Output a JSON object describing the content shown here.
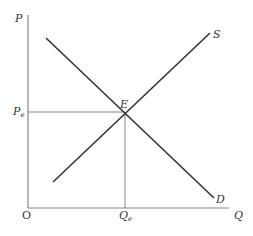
{
  "diagram": {
    "type": "supply-demand",
    "axes": {
      "y_label": "P",
      "x_label": "Q",
      "origin_label": "O"
    },
    "curves": [
      {
        "name": "demand",
        "label": "D"
      },
      {
        "name": "supply",
        "label": "S"
      }
    ],
    "equilibrium": {
      "point_label": "E",
      "price_label": "P",
      "price_subscript": "e",
      "quantity_label": "Q",
      "quantity_subscript": "e"
    },
    "colors": {
      "axis": "#888888",
      "curve": "#333333",
      "text": "#333333"
    }
  }
}
